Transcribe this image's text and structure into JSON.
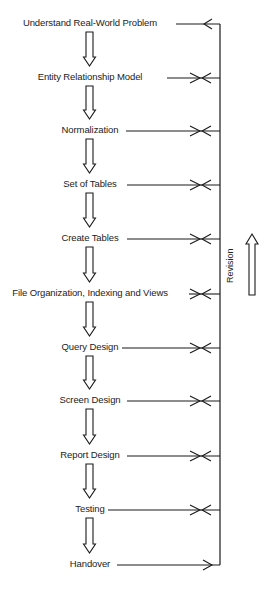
{
  "diagram": {
    "steps": [
      {
        "label": "Understand Real-World Problem",
        "y": 24,
        "line_start": 176,
        "marker": "single-left"
      },
      {
        "label": "Entity Relationship Model",
        "y": 78,
        "line_start": 167,
        "marker": "double"
      },
      {
        "label": "Normalization",
        "y": 131,
        "line_start": 126,
        "marker": "double"
      },
      {
        "label": "Set of Tables",
        "y": 185,
        "line_start": 127,
        "marker": "double"
      },
      {
        "label": "Create Tables",
        "y": 239,
        "line_start": 127,
        "marker": "double"
      },
      {
        "label": "File Organization, Indexing and Views",
        "y": 294,
        "line_start": 189,
        "marker": "double"
      },
      {
        "label": "Query Design",
        "y": 348,
        "line_start": 122,
        "marker": "double"
      },
      {
        "label": "Screen Design",
        "y": 401,
        "line_start": 127,
        "marker": "double"
      },
      {
        "label": "Report Design",
        "y": 456,
        "line_start": 127,
        "marker": "double"
      },
      {
        "label": "Testing",
        "y": 510,
        "line_start": 108,
        "marker": "double"
      },
      {
        "label": "Handover",
        "y": 565,
        "line_start": 117,
        "marker": "single-right"
      }
    ],
    "revision_label": "Revision",
    "line_color": "#1a1a1a"
  }
}
